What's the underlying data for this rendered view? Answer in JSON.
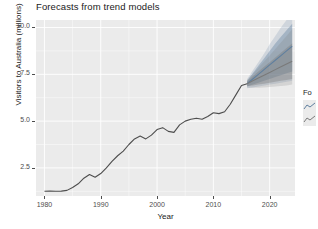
{
  "chart_data": {
    "type": "line",
    "title": "Forecasts from trend models",
    "xlabel": "Year",
    "ylabel": "Visitors to Australia (millions)",
    "xlim": [
      1978.5,
      2024.5
    ],
    "ylim": [
      1.0,
      10.4
    ],
    "grid": true,
    "x_ticks": [
      "1980",
      "1990",
      "2000",
      "2010",
      "2020"
    ],
    "x_tick_values": [
      1980,
      1990,
      2000,
      2010,
      2020
    ],
    "y_ticks": [
      "10.0",
      "7.5",
      "5.0",
      "2.5"
    ],
    "y_tick_values": [
      10.0,
      7.5,
      5.0,
      2.5
    ],
    "legend": {
      "position": "right",
      "title": "Fo",
      "entries": [
        {
          "label": "",
          "color": "#6b8fb5"
        },
        {
          "label": "",
          "color": "#8d8d8d"
        }
      ]
    },
    "series": [
      {
        "name": "Visitors to Australia",
        "type": "historical",
        "color": "#4d4d4d",
        "x": [
          1980,
          1981,
          1982,
          1983,
          1984,
          1985,
          1986,
          1987,
          1988,
          1989,
          1990,
          1991,
          1992,
          1993,
          1994,
          1995,
          1996,
          1997,
          1998,
          1999,
          2000,
          2001,
          2002,
          2003,
          2004,
          2005,
          2006,
          2007,
          2008,
          2009,
          2010,
          2011,
          2012,
          2013,
          2014,
          2015,
          2016
        ],
        "values": [
          1.25,
          1.26,
          1.25,
          1.26,
          1.3,
          1.45,
          1.65,
          1.95,
          2.15,
          2.0,
          2.2,
          2.5,
          2.85,
          3.15,
          3.4,
          3.75,
          4.05,
          4.2,
          4.05,
          4.25,
          4.55,
          4.65,
          4.45,
          4.4,
          4.8,
          5.0,
          5.1,
          5.15,
          5.1,
          5.25,
          5.45,
          5.4,
          5.5,
          5.9,
          6.4,
          6.9,
          7.0
        ]
      },
      {
        "name": "forecast-model-1",
        "type": "forecast",
        "color": "#5f7f9f",
        "x": [
          2016,
          2017,
          2018,
          2019,
          2020,
          2021,
          2022,
          2023,
          2024
        ],
        "mean": [
          7.0,
          7.25,
          7.5,
          7.75,
          8.0,
          8.25,
          8.5,
          8.75,
          9.0
        ],
        "lower_80": [
          6.85,
          6.95,
          7.05,
          7.15,
          7.25,
          7.35,
          7.45,
          7.55,
          7.65
        ],
        "upper_80": [
          7.15,
          7.55,
          7.95,
          8.35,
          8.75,
          9.15,
          9.5,
          9.85,
          10.2
        ],
        "lower_95": [
          6.75,
          6.8,
          6.85,
          6.9,
          6.95,
          7.0,
          7.05,
          7.1,
          7.15
        ],
        "upper_95": [
          7.25,
          7.7,
          8.15,
          8.6,
          9.1,
          9.55,
          10.0,
          10.4,
          10.4
        ]
      },
      {
        "name": "forecast-model-2",
        "type": "forecast",
        "color": "#7a7a7a",
        "x": [
          2016,
          2017,
          2018,
          2019,
          2020,
          2021,
          2022,
          2023,
          2024
        ],
        "mean": [
          7.0,
          7.15,
          7.3,
          7.45,
          7.6,
          7.75,
          7.9,
          8.05,
          8.2
        ],
        "lower_80": [
          6.88,
          6.9,
          6.95,
          7.0,
          7.05,
          7.1,
          7.15,
          7.2,
          7.25
        ],
        "upper_80": [
          7.12,
          7.4,
          7.65,
          7.9,
          8.15,
          8.4,
          8.65,
          8.9,
          9.15
        ],
        "lower_95": [
          6.8,
          6.78,
          6.78,
          6.8,
          6.82,
          6.85,
          6.88,
          6.9,
          6.95
        ],
        "upper_95": [
          7.2,
          7.52,
          7.85,
          8.18,
          8.5,
          8.85,
          9.2,
          9.55,
          9.9
        ]
      }
    ]
  }
}
